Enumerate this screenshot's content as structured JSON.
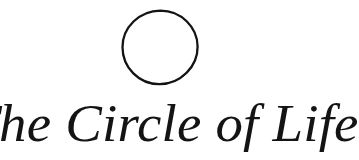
{
  "image": {
    "kind": "logo-title-graphic",
    "width": 327,
    "height": 160,
    "background_color": "#ffffff",
    "ink_color": "#141414"
  },
  "mark": {
    "name": "open-circle",
    "shape": "circle",
    "style": "hand-drawn open ring, unfilled",
    "center_x": 160,
    "center_y": 47,
    "radius": 36,
    "stroke_width": 2.3,
    "stroke_color": "#141414",
    "fill": "none"
  },
  "wordmark": {
    "text": "The Circle of Life",
    "words": [
      "The",
      "Circle",
      "of",
      "Life"
    ],
    "style": "italic serif",
    "color": "#141414",
    "font_size_px": 53,
    "baseline_y": 140,
    "cap_height_px": 37,
    "left_x": 2,
    "right_x": 322
  }
}
